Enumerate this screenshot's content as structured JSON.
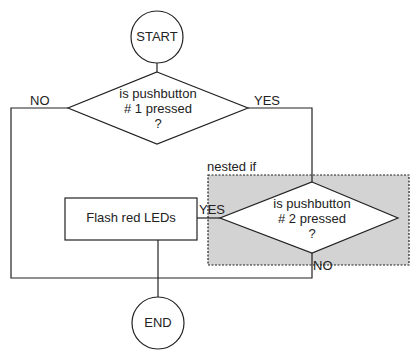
{
  "diagram": {
    "type": "flowchart",
    "colors": {
      "line": "#222222",
      "nested_fill": "#d3d3d3",
      "shape_fill": "#ffffff"
    },
    "start": {
      "label": "START"
    },
    "end": {
      "label": "END"
    },
    "decision1": {
      "line1": "is pushbutton",
      "line2": "# 1 pressed",
      "line3": "?",
      "yes_label": "YES",
      "no_label": "NO"
    },
    "nested": {
      "label": "nested if"
    },
    "decision2": {
      "line1": "is pushbutton",
      "line2": "# 2 pressed",
      "line3": "?",
      "yes_label": "YES",
      "no_label": "NO"
    },
    "action": {
      "label": "Flash red LEDs"
    }
  }
}
